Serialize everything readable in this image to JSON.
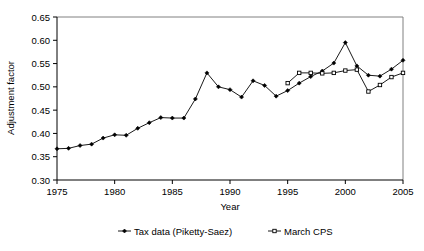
{
  "chart_data": {
    "type": "line",
    "title": "",
    "xlabel": "Year",
    "ylabel": "Adjustment factor",
    "xlim": [
      1975,
      2005
    ],
    "ylim": [
      0.3,
      0.65
    ],
    "xticks": [
      1975,
      1980,
      1985,
      1990,
      1995,
      2000,
      2005
    ],
    "xtick_labels": [
      "1975",
      "1980",
      "1985",
      "1990",
      "1995",
      "2000",
      "2005"
    ],
    "yticks": [
      0.3,
      0.35,
      0.4,
      0.45,
      0.5,
      0.55,
      0.6,
      0.65
    ],
    "ytick_labels": [
      "0.30",
      "0.35",
      "0.40",
      "0.45",
      "0.50",
      "0.55",
      "0.60",
      "0.65"
    ],
    "grid": false,
    "legend_position": "bottom",
    "series": [
      {
        "name": "Tax data (Piketty-Saez)",
        "marker": "filled-diamond",
        "color": "#000000",
        "x": [
          1975,
          1976,
          1977,
          1978,
          1979,
          1980,
          1981,
          1982,
          1983,
          1984,
          1985,
          1986,
          1987,
          1988,
          1989,
          1990,
          1991,
          1992,
          1993,
          1994,
          1995,
          1996,
          1997,
          1998,
          1999,
          2000,
          2001,
          2002,
          2003,
          2004,
          2005
        ],
        "values": [
          0.367,
          0.368,
          0.374,
          0.377,
          0.39,
          0.397,
          0.396,
          0.411,
          0.423,
          0.434,
          0.433,
          0.433,
          0.474,
          0.53,
          0.5,
          0.494,
          0.478,
          0.513,
          0.503,
          0.48,
          0.492,
          0.508,
          0.522,
          0.534,
          0.551,
          0.595,
          0.545,
          0.525,
          0.523,
          0.538,
          0.557
        ]
      },
      {
        "name": "March CPS",
        "marker": "open-square",
        "color": "#000000",
        "x": [
          1995,
          1996,
          1997,
          1998,
          1999,
          2000,
          2001,
          2002,
          2003,
          2004,
          2005
        ],
        "values": [
          0.508,
          0.53,
          0.53,
          0.529,
          0.53,
          0.535,
          0.537,
          0.49,
          0.504,
          0.521,
          0.53
        ]
      }
    ]
  },
  "legend": {
    "items": [
      {
        "label": "Tax data (Piketty-Saez)",
        "marker": "filled-diamond"
      },
      {
        "label": "March CPS",
        "marker": "open-square"
      }
    ]
  },
  "axes": {
    "y_title": "Adjustment factor",
    "x_title": "Year"
  }
}
